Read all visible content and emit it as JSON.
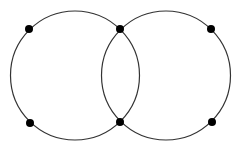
{
  "canvas": {
    "width": 236,
    "height": 151,
    "background": "#ffffff"
  },
  "style": {
    "stroke_color": "#333333",
    "stroke_width": 1.2,
    "node_color": "#000000",
    "node_radius": 4
  },
  "circles": [
    {
      "id": "left-circle",
      "cx": 75,
      "cy": 75.5,
      "r": 64.5
    },
    {
      "id": "right-circle",
      "cx": 166,
      "cy": 75.5,
      "r": 64.5
    }
  ],
  "nodes": [
    {
      "id": "node-left-top",
      "x": 29,
      "y": 29
    },
    {
      "id": "node-left-bottom",
      "x": 30,
      "y": 123
    },
    {
      "id": "node-intersection-top",
      "x": 120,
      "y": 29
    },
    {
      "id": "node-intersection-bottom",
      "x": 120,
      "y": 122
    },
    {
      "id": "node-right-top",
      "x": 211,
      "y": 29
    },
    {
      "id": "node-right-bottom",
      "x": 212,
      "y": 122
    }
  ]
}
